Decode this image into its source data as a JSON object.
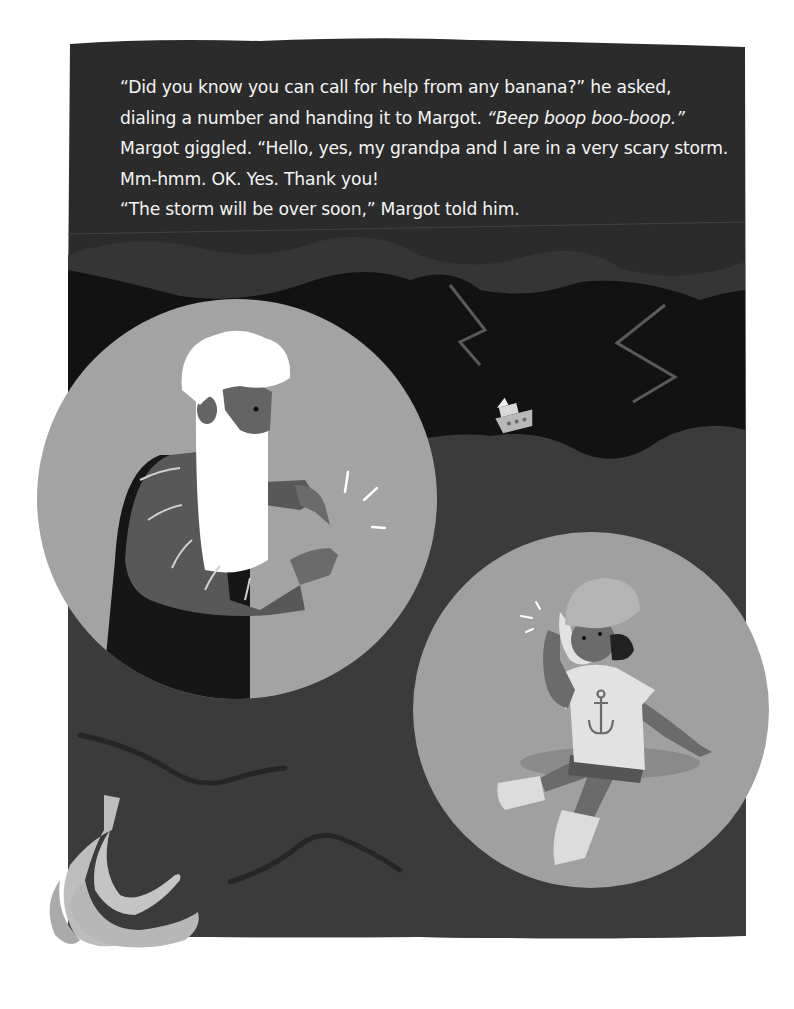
{
  "page": {
    "type": "picture-book-page",
    "colors": {
      "background": "#ffffff",
      "text_panel": "#2b2b2b",
      "storm_band": "#353535",
      "night_sky": "#121212",
      "sea": "#3b3b3b",
      "bubble": "#a3a3a3",
      "text": "#f4f4f4",
      "banana": "#bdbdbd"
    }
  },
  "story": {
    "lines": [
      {
        "text": "“Did you know you can call for help from any banana?” he asked,"
      },
      {
        "text": "dialing a number and handing it to Margot. ",
        "italic": "“Beep boop boo-boop.”"
      },
      {
        "text": "Margot giggled. “Hello, yes, my grandpa and I are in a very scary storm."
      },
      {
        "text": "Mm-hmm. OK. Yes. Thank you!"
      },
      {
        "text": "“The storm will be over soon,” Margot told him."
      }
    ]
  },
  "illustration": {
    "scene": "stormy sea at night",
    "elements": [
      {
        "name": "lightning-bolt",
        "count": 2
      },
      {
        "name": "boat",
        "label": "small boat tossed on waves"
      },
      {
        "name": "grandpa-bubble",
        "label": "Grandpa with white beard holding a banana like a phone"
      },
      {
        "name": "margot-bubble",
        "label": "Margot in anchor t-shirt holding banana to her ear"
      },
      {
        "name": "banana-bunch",
        "label": "bunch of bananas"
      }
    ]
  }
}
